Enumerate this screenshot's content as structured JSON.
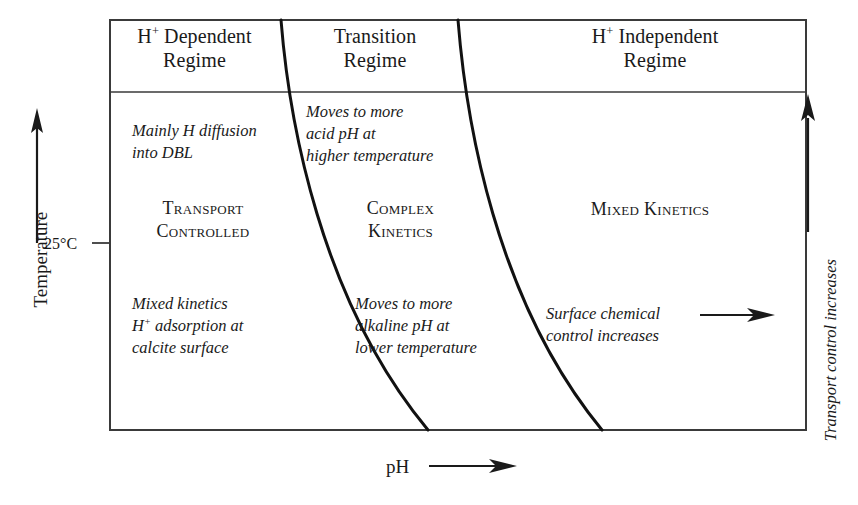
{
  "diagram": {
    "frame": {
      "x": 110,
      "y": 20,
      "width": 696,
      "height": 410,
      "header_divider_y": 92
    },
    "regimes": [
      {
        "id": "h-dependent",
        "title_line1": "H",
        "title_sup": "+",
        "title_line1_rest": " Dependent",
        "title_line2": "Regime",
        "upper_note": [
          "Mainly H diffusion",
          "into DBL"
        ],
        "center_label": [
          "Transport",
          "Controlled"
        ],
        "lower_note": [
          "Mixed kinetics",
          "H+ adsorption at",
          "calcite surface"
        ]
      },
      {
        "id": "transition",
        "title_line1": "Transition",
        "title_line2": "Regime",
        "upper_note": [
          "Moves to more",
          "acid pH at",
          "higher temperature"
        ],
        "center_label": [
          "Complex",
          "Kinetics"
        ],
        "lower_note": [
          "Moves to more",
          "alkaline pH at",
          "lower temperature"
        ]
      },
      {
        "id": "h-independent",
        "title_line1": "H",
        "title_sup": "+",
        "title_line1_rest": " Independent",
        "title_line2": "Regime",
        "center_label": [
          "Mixed Kinetics"
        ],
        "lower_note": [
          "Surface chemical",
          "control increases"
        ]
      }
    ],
    "axes": {
      "y_label": "Temperature",
      "y_tick_label": "25°C",
      "y_tick_value": 25,
      "y_tick_units": "°C",
      "x_label": "pH",
      "right_label": "Transport control increases"
    },
    "boundary_curves": [
      {
        "id": "left-boundary",
        "path": "M 281 20 C 289 120, 320 300, 428 430"
      },
      {
        "id": "right-boundary",
        "path": "M 458 20 C 466 120, 495 300, 602 430"
      }
    ],
    "colors": {
      "ink": "#1a1a1a",
      "frame": "#3a3a3a",
      "background": "#ffffff"
    }
  },
  "labels": {
    "h_dep_title_prefix": "H",
    "h_dep_sup": "+",
    "h_dep_title_suffix": " Dependent",
    "regime_word": "Regime",
    "transition_title": "Transition",
    "h_indep_title_prefix": "H",
    "h_indep_sup": "+",
    "h_indep_title_suffix": " Independent",
    "note_mainly_1": "Mainly H diffusion",
    "note_mainly_2": "into DBL",
    "sc_transport_1": "Transport",
    "sc_transport_2": "Controlled",
    "note_mixed_1": "Mixed kinetics",
    "note_mixed_2_prefix": "H",
    "note_mixed_2_sup": "+",
    "note_mixed_2_suffix": " adsorption at",
    "note_mixed_3": "calcite surface",
    "note_acid_1": "Moves to more",
    "note_acid_2": "acid pH at",
    "note_acid_3": "higher temperature",
    "sc_complex_1": "Complex",
    "sc_complex_2": "Kinetics",
    "note_alkaline_1": "Moves to more",
    "note_alkaline_2": "alkaline pH at",
    "note_alkaline_3": "lower temperature",
    "sc_mixed_kinetics": "Mixed Kinetics",
    "note_surface_1": "Surface chemical",
    "note_surface_2": "control increases",
    "axis_temperature": "Temperature",
    "axis_tick_25c": "25°C",
    "axis_ph": "pH",
    "axis_transport_control": "Transport control increases"
  }
}
